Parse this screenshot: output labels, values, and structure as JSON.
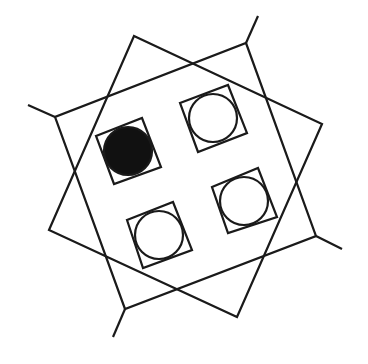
{
  "diagram": {
    "background": "#ffffff",
    "stroke_color": "#1a1a1a",
    "fill_color": "#111111",
    "stroke_width": 2.2,
    "large_squares": [
      {
        "name": "square-a",
        "points": "134,36 322,124 237,317 49,230"
      },
      {
        "name": "square-b",
        "points": "246,43 316,236 125,309 55,117"
      }
    ],
    "extensions": [
      {
        "name": "extension-left",
        "x1": 55,
        "y1": 117,
        "x2": 28,
        "y2": 105
      },
      {
        "name": "extension-top",
        "x1": 246,
        "y1": 43,
        "x2": 258,
        "y2": 16
      },
      {
        "name": "extension-right",
        "x1": 316,
        "y1": 236,
        "x2": 342,
        "y2": 249
      },
      {
        "name": "extension-bottom",
        "x1": 125,
        "y1": 309,
        "x2": 113,
        "y2": 337
      }
    ],
    "small_squares": [
      {
        "name": "cell-top-left",
        "points": "96,136 142,118 161,167 114,184",
        "cx": 128,
        "cy": 151,
        "r": 24,
        "filled": true
      },
      {
        "name": "cell-top-right",
        "points": "180,103 228,85 247,133 198,152",
        "cx": 213,
        "cy": 118,
        "r": 24,
        "filled": false
      },
      {
        "name": "cell-bottom-left",
        "points": "127,220 173,202 192,250 143,268",
        "cx": 159,
        "cy": 235,
        "r": 24,
        "filled": false
      },
      {
        "name": "cell-bottom-right",
        "points": "212,187 258,168 277,217 228,233",
        "cx": 244,
        "cy": 201,
        "r": 24,
        "filled": false
      }
    ]
  }
}
